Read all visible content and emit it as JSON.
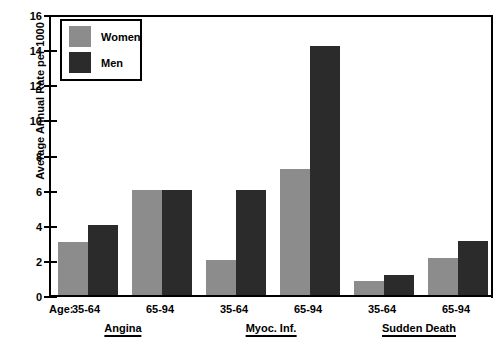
{
  "chart_data": {
    "type": "bar",
    "title": "",
    "xlabel": "Age:",
    "ylabel": "Average Annual Rate per 1000",
    "ylim": [
      0,
      16
    ],
    "ytick_step": 2,
    "yticks": [
      "16",
      "14",
      "12",
      "10",
      "8",
      "6",
      "4",
      "2",
      "0"
    ],
    "grid": false,
    "legend_position": "top-left",
    "categories": [
      "35-64",
      "65-94",
      "35-64",
      "65-94",
      "35-64",
      "65-94"
    ],
    "groups": [
      {
        "name": "Angina",
        "age_bands": [
          "35-64",
          "65-94"
        ]
      },
      {
        "name": "Myoc. Inf.",
        "age_bands": [
          "35-64",
          "65-94"
        ]
      },
      {
        "name": "Sudden Death",
        "age_bands": [
          "35-64",
          "65-94"
        ]
      }
    ],
    "series": [
      {
        "name": "Women",
        "color": "#8c8c8c",
        "values": [
          3.0,
          6.0,
          2.0,
          7.2,
          0.8,
          2.1
        ]
      },
      {
        "name": "Men",
        "color": "#2b2b2b",
        "values": [
          4.0,
          6.0,
          6.0,
          14.2,
          1.15,
          3.1
        ]
      }
    ]
  },
  "legend": {
    "items": [
      {
        "label": "Women",
        "color": "#8c8c8c"
      },
      {
        "label": "Men",
        "color": "#2b2b2b"
      }
    ]
  },
  "axis": {
    "age_prefix": "Age:"
  }
}
